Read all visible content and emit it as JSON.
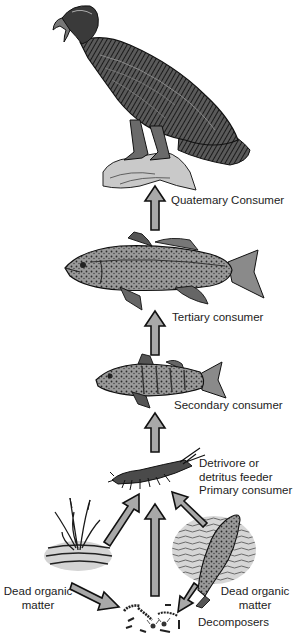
{
  "diagram": {
    "type": "food-chain",
    "colors": {
      "arrow_fill": "#a8a8a8",
      "arrow_stroke": "#111111",
      "ink": "#1c1c1c",
      "wash": "#d6d6d6",
      "background": "#ffffff"
    },
    "levels": [
      {
        "id": "eagle",
        "organism": "eagle",
        "label": "Quatemary  Consumer"
      },
      {
        "id": "bass",
        "organism": "bass",
        "label": "Tertiary consumer"
      },
      {
        "id": "perch",
        "organism": "perch",
        "label": "Secondary consumer"
      },
      {
        "id": "crayfish",
        "organism": "crayfish",
        "label_lines": [
          "Detrivore or",
          "detritus feeder",
          "Primary consumer"
        ]
      }
    ],
    "sources": {
      "plant": {
        "organism": "dead-plant",
        "label_lines": [
          "Dead organic",
          "matter"
        ]
      },
      "fish": {
        "organism": "dead-fish",
        "label_lines": [
          "Dead organic",
          "matter"
        ]
      },
      "decomposers": {
        "organism": "decomposers",
        "label": "Decomposers"
      }
    },
    "arrows": [
      {
        "from": "bass",
        "to": "eagle"
      },
      {
        "from": "perch",
        "to": "bass"
      },
      {
        "from": "crayfish",
        "to": "perch"
      },
      {
        "from": "plant",
        "to": "crayfish"
      },
      {
        "from": "decomposers",
        "to": "crayfish"
      },
      {
        "from": "fish",
        "to": "crayfish"
      },
      {
        "from": "plant",
        "to": "decomposers"
      },
      {
        "from": "fish",
        "to": "decomposers"
      }
    ]
  }
}
